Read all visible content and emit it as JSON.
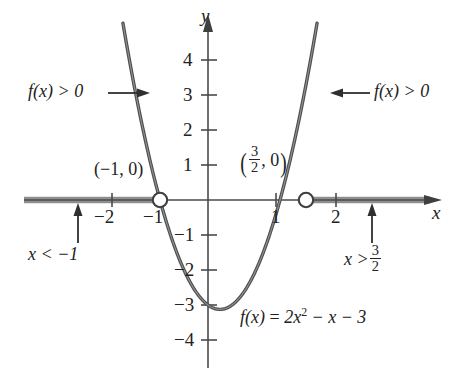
{
  "figure": {
    "type": "cartesian-plot",
    "function_label": "f(x) = 2x² − x − 3",
    "axis_labels": {
      "x": "x",
      "y": "y"
    },
    "x_ticks": [
      {
        "value": -2,
        "label": "−2"
      },
      {
        "value": -1,
        "label": "−1"
      },
      {
        "value": 1,
        "label": "1"
      },
      {
        "value": 2,
        "label": "2"
      }
    ],
    "y_ticks": [
      {
        "value": 4,
        "label": "4"
      },
      {
        "value": 3,
        "label": "3"
      },
      {
        "value": 2,
        "label": "2"
      },
      {
        "value": 1,
        "label": "1"
      },
      {
        "value": -1,
        "label": "−1"
      },
      {
        "value": -2,
        "label": "−2"
      },
      {
        "value": -3,
        "label": "−3"
      },
      {
        "value": -4,
        "label": "−4"
      }
    ],
    "intercept_left": {
      "label": "(−1, 0)",
      "x": -1,
      "y": 0
    },
    "intercept_right": {
      "label_num": "3",
      "label_den": "2",
      "label_tail": ", 0",
      "x": 1.5,
      "y": 0
    },
    "annotations": {
      "left_positive": "f(x) > 0",
      "right_positive": "f(x) > 0",
      "left_solution": "x < −1",
      "right_solution_prefix": "x >",
      "right_solution_num": "3",
      "right_solution_den": "2"
    },
    "equation": {
      "lhs": "f(x)",
      "eq": "=",
      "coef": "2x",
      "exp": "2",
      "rest": "− x − 3"
    },
    "colors": {
      "curve": "#4a4a4a",
      "axis": "#4a4a4a",
      "solution_ray": "#8c8c8c",
      "text": "#222222",
      "background": "#ffffff"
    }
  },
  "chart_data": {
    "type": "line",
    "title": "",
    "xlabel": "x",
    "ylabel": "y",
    "xlim": [
      -4.3,
      5.3
    ],
    "ylim": [
      -4.8,
      5.0
    ],
    "grid": false,
    "legend": null,
    "function": "f(x) = 2x^2 - x - 3",
    "coefficients": {
      "a": 2,
      "b": -1,
      "c": -3
    },
    "roots": [
      -1,
      1.5
    ],
    "vertex": {
      "x": 0.25,
      "y": -3.125
    },
    "y_intercept": -3,
    "series": [
      {
        "name": "f(x) = 2x² − x − 3",
        "x": [
          -2.1,
          -2.0,
          -1.8,
          -1.6,
          -1.4,
          -1.2,
          -1.0,
          -0.8,
          -0.6,
          -0.4,
          -0.2,
          0.0,
          0.25,
          0.5,
          0.75,
          1.0,
          1.25,
          1.5,
          1.75,
          2.0,
          2.2,
          2.4,
          2.5
        ],
        "y": [
          7.92,
          7.0,
          5.28,
          3.72,
          2.32,
          1.08,
          0.0,
          -0.92,
          -1.68,
          -2.28,
          -2.72,
          -3.0,
          -3.125,
          -3.0,
          -2.625,
          -2.0,
          -1.125,
          0.0,
          1.375,
          3.0,
          8.08,
          10.12,
          7.0
        ]
      }
    ],
    "x_ticks": [
      -2,
      -1,
      1,
      2
    ],
    "y_ticks": [
      -4,
      -3,
      -2,
      -1,
      1,
      2,
      3,
      4
    ],
    "markers": [
      {
        "x": -1,
        "y": 0,
        "style": "open-circle",
        "label": "(-1, 0)"
      },
      {
        "x": 1.5,
        "y": 0,
        "style": "open-circle",
        "label": "(3/2, 0)"
      }
    ],
    "shaded_regions": [
      {
        "axis": "x",
        "from": "-infinity",
        "to": -1,
        "meaning": "f(x) > 0"
      },
      {
        "axis": "x",
        "from": 1.5,
        "to": "+infinity",
        "meaning": "f(x) > 0"
      }
    ],
    "annotations": [
      {
        "text": "f(x) > 0",
        "at": [
          -2.6,
          3.0
        ],
        "arrow": "right"
      },
      {
        "text": "f(x) > 0",
        "at": [
          3.3,
          3.0
        ],
        "arrow": "left"
      },
      {
        "text": "x < -1",
        "at": [
          -2.9,
          -1.6
        ]
      },
      {
        "text": "x > 3/2",
        "at": [
          2.8,
          -1.6
        ]
      },
      {
        "text": "f(x) = 2x^2 - x - 3",
        "at": [
          1.2,
          -3.7
        ]
      }
    ]
  }
}
